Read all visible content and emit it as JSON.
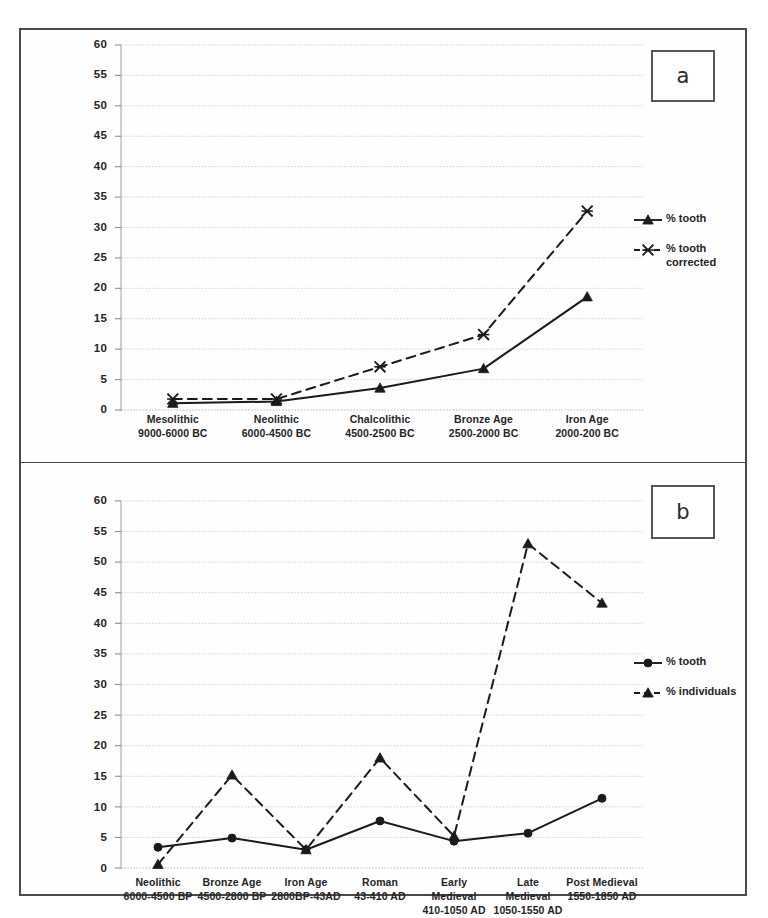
{
  "figure": {
    "panels": [
      {
        "letter": "a",
        "chart_data": {
          "type": "line",
          "title": "",
          "xlabel": "",
          "ylabel": "",
          "ylim": [
            0,
            60
          ],
          "ytick_step": 5,
          "yticks": [
            0,
            5,
            10,
            15,
            20,
            25,
            30,
            35,
            40,
            45,
            50,
            55,
            60
          ],
          "grid": true,
          "legend_position": "right",
          "categories": [
            "Mesolithic\n9000-6000 BC",
            "Neolithic\n6000-4500 BC",
            "Chalcolithic\n4500-2500 BC",
            "Bronze Age\n2500-2000 BC",
            "Iron Age\n2000-200 BC"
          ],
          "category_lines": [
            [
              "Mesolithic",
              "9000-6000 BC"
            ],
            [
              "Neolithic",
              "6000-4500 BC"
            ],
            [
              "Chalcolithic",
              "4500-2500 BC"
            ],
            [
              "Bronze Age",
              "2500-2000 BC"
            ],
            [
              "Iron Age",
              "2000-200 BC"
            ]
          ],
          "series": [
            {
              "name": "% tooth",
              "marker": "triangle",
              "line_style": "solid",
              "values": [
                1.1,
                1.4,
                3.6,
                6.8,
                18.6
              ]
            },
            {
              "name": "% tooth corrected",
              "marker": "cross",
              "line_style": "dashed",
              "values": [
                1.8,
                1.8,
                7.1,
                12.4,
                32.7
              ]
            }
          ]
        }
      },
      {
        "letter": "b",
        "chart_data": {
          "type": "line",
          "title": "",
          "xlabel": "",
          "ylabel": "",
          "ylim": [
            0,
            60
          ],
          "ytick_step": 5,
          "yticks": [
            0,
            5,
            10,
            15,
            20,
            25,
            30,
            35,
            40,
            45,
            50,
            55,
            60
          ],
          "grid": true,
          "legend_position": "right",
          "categories": [
            "Neolithic\n6000-4500 BP",
            "Bronze Age\n4500-2800 BP",
            "Iron Age\n2800BP-43AD",
            "Roman\n43-410 AD",
            "Early Medieval\n410-1050 AD",
            "Late Medieval\n1050-1550 AD",
            "Post Medieval\n1550-1850 AD"
          ],
          "category_lines": [
            [
              "Neolithic",
              "6000-4500 BP"
            ],
            [
              "Bronze Age",
              "4500-2800 BP"
            ],
            [
              "Iron Age",
              "2800BP-43AD"
            ],
            [
              "Roman",
              "43-410 AD"
            ],
            [
              "Early",
              "Medieval",
              "410-1050 AD"
            ],
            [
              "Late",
              "Medieval",
              "1050-1550 AD"
            ],
            [
              "Post Medieval",
              "1550-1850 AD"
            ]
          ],
          "series": [
            {
              "name": "% tooth",
              "marker": "circle",
              "line_style": "solid",
              "values": [
                3.4,
                4.9,
                3.0,
                7.7,
                4.4,
                5.7,
                11.4
              ]
            },
            {
              "name": "% individuals",
              "marker": "triangle",
              "line_style": "dashed",
              "values": [
                0.6,
                15.2,
                3.0,
                18.0,
                5.2,
                53.0,
                43.3
              ]
            }
          ]
        }
      }
    ]
  },
  "colors": {
    "line": "#1a1a1a",
    "grid": "#c9c9d4",
    "axis": "#555555",
    "frame": "#4a4a4a"
  }
}
